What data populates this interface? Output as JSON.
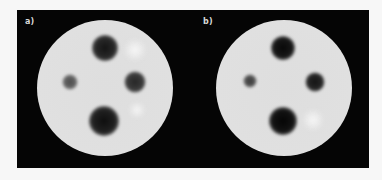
{
  "figure": {
    "background_color": "#050505",
    "page_background": "#f7f7f7",
    "panels": [
      {
        "label": "a)",
        "disc": {
          "cx": 88,
          "cy": 78,
          "r": 68,
          "fill": "#dedede"
        },
        "spots": [
          {
            "name": "top",
            "cx": 88,
            "cy": 38,
            "r": 12,
            "color": "#1a1a1a"
          },
          {
            "name": "left",
            "cx": 53,
            "cy": 72,
            "r": 7,
            "color": "#5a5a5a"
          },
          {
            "name": "right",
            "cx": 118,
            "cy": 72,
            "r": 10,
            "color": "#3a3a3a"
          },
          {
            "name": "bottom",
            "cx": 87,
            "cy": 111,
            "r": 14,
            "color": "#151515"
          }
        ]
      },
      {
        "label": "b)",
        "disc": {
          "cx": 89,
          "cy": 78,
          "r": 68,
          "fill": "#dedede"
        },
        "spots": [
          {
            "name": "top",
            "cx": 88,
            "cy": 38,
            "r": 11,
            "color": "#111111"
          },
          {
            "name": "left",
            "cx": 55,
            "cy": 71,
            "r": 6,
            "color": "#4a4a4a"
          },
          {
            "name": "right",
            "cx": 120,
            "cy": 72,
            "r": 9,
            "color": "#252525"
          },
          {
            "name": "bottom",
            "cx": 88,
            "cy": 111,
            "r": 13,
            "color": "#0a0a0a"
          }
        ]
      }
    ]
  }
}
